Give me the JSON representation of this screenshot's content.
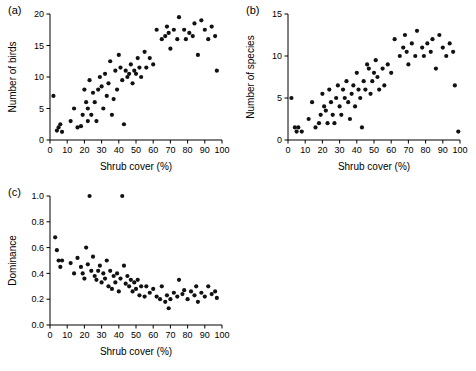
{
  "figure": {
    "background": "#ffffff",
    "point_color": "#111111",
    "axis_color": "#000000"
  },
  "panels": [
    {
      "tag": "(a)",
      "name": "panel-a-number-of-birds"
    },
    {
      "tag": "(b)",
      "name": "panel-b-number-of-species"
    },
    {
      "tag": "(c)",
      "name": "panel-c-dominance"
    }
  ],
  "chart_data": [
    {
      "type": "scatter",
      "title": "(a)",
      "xlabel": "Shrub cover (%)",
      "ylabel": "Number of birds",
      "xlim": [
        0,
        100
      ],
      "ylim": [
        0,
        20
      ],
      "xticks": [
        0,
        10,
        20,
        30,
        40,
        50,
        60,
        70,
        80,
        90,
        100
      ],
      "yticks": [
        0,
        5,
        10,
        15,
        20
      ],
      "grid": false,
      "legend": "none",
      "points": [
        [
          2,
          7.0
        ],
        [
          4,
          1.5
        ],
        [
          5,
          2.0
        ],
        [
          6,
          2.5
        ],
        [
          7,
          1.3
        ],
        [
          12,
          3.0
        ],
        [
          14,
          5.0
        ],
        [
          16,
          2.0
        ],
        [
          18,
          2.2
        ],
        [
          19,
          4.0
        ],
        [
          20,
          8.0
        ],
        [
          21,
          6.0
        ],
        [
          22,
          5.0
        ],
        [
          22,
          3.0
        ],
        [
          23,
          9.5
        ],
        [
          24,
          4.0
        ],
        [
          25,
          7.5
        ],
        [
          26,
          6.0
        ],
        [
          27,
          3.0
        ],
        [
          28,
          8.0
        ],
        [
          29,
          10.0
        ],
        [
          30,
          8.5
        ],
        [
          31,
          5.0
        ],
        [
          32,
          10.5
        ],
        [
          33,
          7.0
        ],
        [
          34,
          9.0
        ],
        [
          35,
          12.5
        ],
        [
          36,
          4.0
        ],
        [
          37,
          6.5
        ],
        [
          38,
          11.0
        ],
        [
          39,
          8.0
        ],
        [
          40,
          13.5
        ],
        [
          41,
          11.5
        ],
        [
          42,
          9.5
        ],
        [
          43,
          2.5
        ],
        [
          44,
          11.0
        ],
        [
          45,
          10.0
        ],
        [
          46,
          10.5
        ],
        [
          47,
          12.0
        ],
        [
          48,
          9.0
        ],
        [
          49,
          11.0
        ],
        [
          50,
          10.5
        ],
        [
          51,
          13.0
        ],
        [
          52,
          11.5
        ],
        [
          53,
          10.0
        ],
        [
          55,
          14.0
        ],
        [
          56,
          11.5
        ],
        [
          58,
          13.0
        ],
        [
          60,
          12.0
        ],
        [
          62,
          17.5
        ],
        [
          65,
          16.0
        ],
        [
          67,
          16.5
        ],
        [
          68,
          18.0
        ],
        [
          69,
          17.0
        ],
        [
          70,
          14.5
        ],
        [
          72,
          17.5
        ],
        [
          74,
          16.0
        ],
        [
          75,
          19.5
        ],
        [
          78,
          17.5
        ],
        [
          79,
          16.0
        ],
        [
          81,
          17.0
        ],
        [
          83,
          16.5
        ],
        [
          84,
          18.5
        ],
        [
          86,
          13.5
        ],
        [
          88,
          19.0
        ],
        [
          90,
          17.5
        ],
        [
          92,
          16.0
        ],
        [
          94,
          18.0
        ],
        [
          96,
          16.5
        ],
        [
          97,
          11.0
        ]
      ]
    },
    {
      "type": "scatter",
      "title": "(b)",
      "xlabel": "Shrub cover (%)",
      "ylabel": "Number of species",
      "xlim": [
        0,
        100
      ],
      "ylim": [
        0,
        15
      ],
      "xticks": [
        0,
        10,
        20,
        30,
        40,
        50,
        60,
        70,
        80,
        90,
        100
      ],
      "yticks": [
        0,
        5,
        10,
        15
      ],
      "grid": false,
      "legend": "none",
      "points": [
        [
          2,
          5.0
        ],
        [
          4,
          1.5
        ],
        [
          5,
          1.0
        ],
        [
          6,
          1.5
        ],
        [
          8,
          1.0
        ],
        [
          12,
          2.5
        ],
        [
          14,
          4.5
        ],
        [
          16,
          1.5
        ],
        [
          18,
          2.0
        ],
        [
          19,
          3.0
        ],
        [
          20,
          5.5
        ],
        [
          21,
          4.0
        ],
        [
          22,
          3.5
        ],
        [
          23,
          2.0
        ],
        [
          24,
          6.0
        ],
        [
          25,
          4.5
        ],
        [
          26,
          3.0
        ],
        [
          27,
          2.0
        ],
        [
          28,
          5.0
        ],
        [
          29,
          6.5
        ],
        [
          30,
          4.0
        ],
        [
          31,
          3.0
        ],
        [
          32,
          6.0
        ],
        [
          33,
          5.0
        ],
        [
          34,
          7.0
        ],
        [
          35,
          4.5
        ],
        [
          36,
          2.5
        ],
        [
          37,
          5.5
        ],
        [
          38,
          6.5
        ],
        [
          39,
          4.0
        ],
        [
          40,
          8.0
        ],
        [
          41,
          6.0
        ],
        [
          42,
          5.0
        ],
        [
          43,
          1.5
        ],
        [
          44,
          7.0
        ],
        [
          45,
          6.0
        ],
        [
          46,
          9.0
        ],
        [
          47,
          8.5
        ],
        [
          48,
          5.5
        ],
        [
          49,
          7.0
        ],
        [
          50,
          8.0
        ],
        [
          51,
          9.5
        ],
        [
          52,
          7.5
        ],
        [
          53,
          6.0
        ],
        [
          55,
          8.5
        ],
        [
          56,
          6.5
        ],
        [
          58,
          9.0
        ],
        [
          60,
          8.0
        ],
        [
          62,
          12.0
        ],
        [
          65,
          10.0
        ],
        [
          67,
          11.0
        ],
        [
          68,
          12.5
        ],
        [
          69,
          10.5
        ],
        [
          70,
          9.0
        ],
        [
          72,
          11.5
        ],
        [
          74,
          10.0
        ],
        [
          75,
          13.0
        ],
        [
          78,
          11.0
        ],
        [
          79,
          10.0
        ],
        [
          81,
          11.5
        ],
        [
          83,
          10.5
        ],
        [
          84,
          12.0
        ],
        [
          86,
          8.5
        ],
        [
          88,
          12.5
        ],
        [
          90,
          11.0
        ],
        [
          92,
          10.0
        ],
        [
          94,
          11.5
        ],
        [
          96,
          10.5
        ],
        [
          97,
          6.5
        ],
        [
          99,
          1.0
        ]
      ]
    },
    {
      "type": "scatter",
      "title": "(c)",
      "xlabel": "Shrub cover (%)",
      "ylabel": "Dominance",
      "xlim": [
        0,
        100
      ],
      "ylim": [
        0.0,
        1.0
      ],
      "xticks": [
        0,
        10,
        20,
        30,
        40,
        50,
        60,
        70,
        80,
        90,
        100
      ],
      "yticks": [
        0.0,
        0.2,
        0.4,
        0.6,
        0.8,
        1.0
      ],
      "grid": false,
      "legend": "none",
      "points": [
        [
          3,
          0.68
        ],
        [
          4,
          0.58
        ],
        [
          5,
          0.5
        ],
        [
          6,
          0.45
        ],
        [
          7,
          0.5
        ],
        [
          12,
          0.48
        ],
        [
          14,
          0.4
        ],
        [
          16,
          0.52
        ],
        [
          18,
          0.45
        ],
        [
          19,
          0.4
        ],
        [
          20,
          0.36
        ],
        [
          21,
          0.6
        ],
        [
          22,
          0.47
        ],
        [
          23,
          1.0
        ],
        [
          24,
          0.42
        ],
        [
          25,
          0.53
        ],
        [
          26,
          0.38
        ],
        [
          27,
          0.35
        ],
        [
          28,
          0.42
        ],
        [
          29,
          0.46
        ],
        [
          30,
          0.33
        ],
        [
          31,
          0.4
        ],
        [
          32,
          0.36
        ],
        [
          33,
          0.5
        ],
        [
          34,
          0.3
        ],
        [
          35,
          0.42
        ],
        [
          36,
          0.28
        ],
        [
          37,
          0.38
        ],
        [
          38,
          0.33
        ],
        [
          39,
          0.4
        ],
        [
          40,
          0.26
        ],
        [
          41,
          0.36
        ],
        [
          42,
          1.0
        ],
        [
          43,
          0.46
        ],
        [
          44,
          0.32
        ],
        [
          45,
          0.38
        ],
        [
          46,
          0.3
        ],
        [
          47,
          0.35
        ],
        [
          48,
          0.26
        ],
        [
          49,
          0.33
        ],
        [
          50,
          0.28
        ],
        [
          51,
          0.35
        ],
        [
          52,
          0.23
        ],
        [
          53,
          0.3
        ],
        [
          55,
          0.22
        ],
        [
          56,
          0.3
        ],
        [
          58,
          0.25
        ],
        [
          60,
          0.28
        ],
        [
          62,
          0.22
        ],
        [
          64,
          0.2
        ],
        [
          65,
          0.3
        ],
        [
          67,
          0.18
        ],
        [
          68,
          0.23
        ],
        [
          69,
          0.13
        ],
        [
          70,
          0.2
        ],
        [
          72,
          0.25
        ],
        [
          74,
          0.22
        ],
        [
          75,
          0.35
        ],
        [
          77,
          0.24
        ],
        [
          78,
          0.27
        ],
        [
          80,
          0.2
        ],
        [
          82,
          0.26
        ],
        [
          84,
          0.23
        ],
        [
          85,
          0.3
        ],
        [
          86,
          0.18
        ],
        [
          88,
          0.25
        ],
        [
          90,
          0.22
        ],
        [
          92,
          0.3
        ],
        [
          94,
          0.24
        ],
        [
          96,
          0.26
        ],
        [
          97,
          0.21
        ]
      ]
    }
  ]
}
